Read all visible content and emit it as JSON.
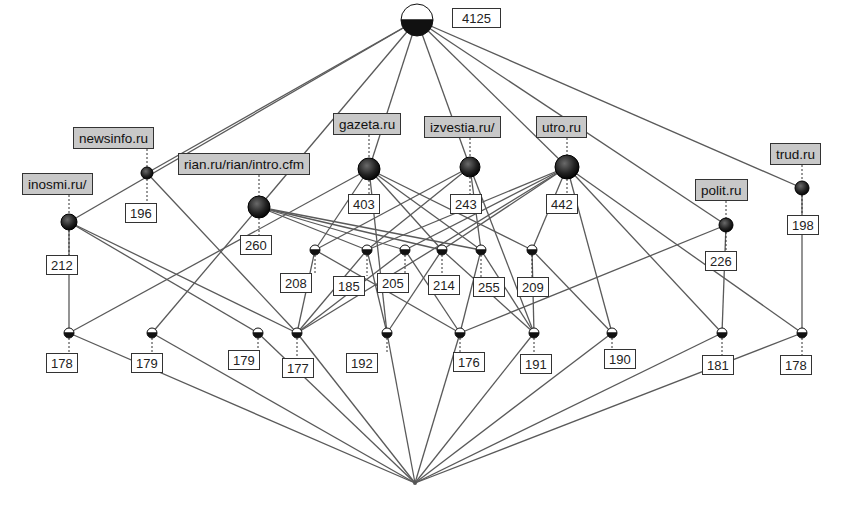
{
  "diagram": {
    "type": "concept-lattice",
    "top": {
      "id": "top",
      "count": "4125",
      "x": 417,
      "y": 20,
      "r": 16
    },
    "bottom": {
      "id": "bottom",
      "x": 415,
      "y": 483,
      "r": 2
    },
    "attributes": [
      {
        "id": "inosmi",
        "label": "inosmi.ru/",
        "count": "212",
        "x": 69,
        "y": 222,
        "r": 8,
        "lx": 22,
        "ly": 173,
        "cx": 46,
        "cy": 255
      },
      {
        "id": "newsinfo",
        "label": "newsinfo.ru",
        "count": "196",
        "x": 147,
        "y": 173,
        "r": 6,
        "lx": 73,
        "ly": 127,
        "cx": 125,
        "cy": 203
      },
      {
        "id": "rian",
        "label": "rian.ru/rian/intro.cfm",
        "count": "260",
        "x": 259,
        "y": 207,
        "r": 11,
        "lx": 178,
        "ly": 153,
        "cx": 240,
        "cy": 235
      },
      {
        "id": "gazeta",
        "label": "gazeta.ru",
        "count": "403",
        "x": 369,
        "y": 169,
        "r": 11,
        "lx": 333,
        "ly": 113,
        "cx": 348,
        "cy": 194
      },
      {
        "id": "izvestia",
        "label": "izvestia.ru/",
        "count": "243",
        "x": 470,
        "y": 167,
        "r": 10,
        "lx": 424,
        "ly": 116,
        "cx": 450,
        "cy": 194
      },
      {
        "id": "utro",
        "label": "utro.ru",
        "count": "442",
        "x": 567,
        "y": 167,
        "r": 12,
        "lx": 536,
        "ly": 116,
        "cx": 546,
        "cy": 194
      },
      {
        "id": "polit",
        "label": "polit.ru",
        "count": "226",
        "x": 726,
        "y": 225,
        "r": 7,
        "lx": 695,
        "ly": 179,
        "cx": 705,
        "cy": 251
      },
      {
        "id": "trud",
        "label": "trud.ru",
        "count": "198",
        "x": 802,
        "y": 188,
        "r": 7,
        "lx": 770,
        "ly": 143,
        "cx": 787,
        "cy": 215
      }
    ],
    "middle": [
      {
        "id": "m208",
        "count": "208",
        "x": 315,
        "y": 250,
        "cx": 280,
        "cy": 273
      },
      {
        "id": "m185",
        "count": "185",
        "x": 367,
        "y": 250,
        "cx": 333,
        "cy": 276
      },
      {
        "id": "m205",
        "count": "205",
        "x": 405,
        "y": 250,
        "cx": 377,
        "cy": 273
      },
      {
        "id": "m214",
        "count": "214",
        "x": 442,
        "y": 250,
        "cx": 428,
        "cy": 275
      },
      {
        "id": "m255",
        "count": "255",
        "x": 481,
        "y": 250,
        "cx": 473,
        "cy": 277
      },
      {
        "id": "m209",
        "count": "209",
        "x": 532,
        "y": 250,
        "cx": 517,
        "cy": 277
      }
    ],
    "lower": [
      {
        "id": "b178a",
        "count": "178",
        "x": 69,
        "y": 333,
        "cx": 46,
        "cy": 353
      },
      {
        "id": "b179a",
        "count": "179",
        "x": 152,
        "y": 333,
        "cx": 131,
        "cy": 353
      },
      {
        "id": "b179b",
        "count": "179",
        "x": 258,
        "y": 333,
        "cx": 228,
        "cy": 350
      },
      {
        "id": "b177",
        "count": "177",
        "x": 297,
        "y": 333,
        "cx": 282,
        "cy": 358
      },
      {
        "id": "b192",
        "count": "192",
        "x": 387,
        "y": 333,
        "cx": 346,
        "cy": 353
      },
      {
        "id": "b176",
        "count": "176",
        "x": 460,
        "y": 333,
        "cx": 453,
        "cy": 352
      },
      {
        "id": "b191",
        "count": "191",
        "x": 534,
        "y": 333,
        "cx": 520,
        "cy": 354
      },
      {
        "id": "b190",
        "count": "190",
        "x": 612,
        "y": 333,
        "cx": 604,
        "cy": 349
      },
      {
        "id": "b181",
        "count": "181",
        "x": 722,
        "y": 333,
        "cx": 702,
        "cy": 355
      },
      {
        "id": "b178b",
        "count": "178",
        "x": 802,
        "y": 333,
        "cx": 780,
        "cy": 355
      }
    ],
    "edges": [
      [
        "top",
        "inosmi"
      ],
      [
        "top",
        "newsinfo"
      ],
      [
        "top",
        "rian"
      ],
      [
        "top",
        "gazeta"
      ],
      [
        "top",
        "izvestia"
      ],
      [
        "top",
        "utro"
      ],
      [
        "top",
        "polit"
      ],
      [
        "top",
        "trud"
      ],
      [
        "inosmi",
        "b178a"
      ],
      [
        "inosmi",
        "b179b"
      ],
      [
        "inosmi",
        "b177"
      ],
      [
        "newsinfo",
        "b177"
      ],
      [
        "rian",
        "b179a"
      ],
      [
        "rian",
        "m185"
      ],
      [
        "rian",
        "m205"
      ],
      [
        "rian",
        "m214"
      ],
      [
        "rian",
        "m255"
      ],
      [
        "gazeta",
        "b178a"
      ],
      [
        "gazeta",
        "m208"
      ],
      [
        "gazeta",
        "m214"
      ],
      [
        "gazeta",
        "m209"
      ],
      [
        "gazeta",
        "b192"
      ],
      [
        "gazeta",
        "m255"
      ],
      [
        "izvestia",
        "m208"
      ],
      [
        "izvestia",
        "m185"
      ],
      [
        "izvestia",
        "m255"
      ],
      [
        "izvestia",
        "b191"
      ],
      [
        "utro",
        "m185"
      ],
      [
        "utro",
        "m205"
      ],
      [
        "utro",
        "m214"
      ],
      [
        "utro",
        "m209"
      ],
      [
        "utro",
        "b177"
      ],
      [
        "utro",
        "b181"
      ],
      [
        "utro",
        "b178b"
      ],
      [
        "utro",
        "b190"
      ],
      [
        "polit",
        "b181"
      ],
      [
        "polit",
        "b176"
      ],
      [
        "trud",
        "b178b"
      ],
      [
        "m208",
        "b177"
      ],
      [
        "m208",
        "b176"
      ],
      [
        "m185",
        "b177"
      ],
      [
        "m185",
        "b192"
      ],
      [
        "m205",
        "b177"
      ],
      [
        "m205",
        "b176"
      ],
      [
        "m214",
        "b192"
      ],
      [
        "m214",
        "b191"
      ],
      [
        "m255",
        "b176"
      ],
      [
        "m255",
        "b191"
      ],
      [
        "m209",
        "b191"
      ],
      [
        "m209",
        "b190"
      ],
      [
        "b178a",
        "bottom"
      ],
      [
        "b179a",
        "bottom"
      ],
      [
        "b179b",
        "bottom"
      ],
      [
        "b177",
        "bottom"
      ],
      [
        "b192",
        "bottom"
      ],
      [
        "b176",
        "bottom"
      ],
      [
        "b191",
        "bottom"
      ],
      [
        "b190",
        "bottom"
      ],
      [
        "b181",
        "bottom"
      ],
      [
        "b178b",
        "bottom"
      ]
    ],
    "colors": {
      "node_dark": "#1a1a1a",
      "node_light": "#ffffff",
      "edge": "#5a5a5a",
      "attr_bg": "#c8c8c8",
      "count_bg": "#ffffff"
    }
  }
}
